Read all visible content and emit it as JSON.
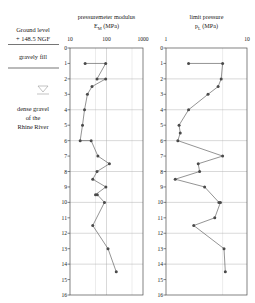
{
  "stratigraphy": {
    "ground_level_line1": "Ground level",
    "ground_level_line2": "+ 148.5 NGF",
    "layer1": "gravely fill",
    "water_table_icon": "water-table-icon",
    "layer2_line1": "dense gravel",
    "layer2_line2": "of the",
    "layer2_line3": "Rhine River"
  },
  "chart_data": [
    {
      "type": "line",
      "id": "pressuremeter-modulus",
      "title": "pressuremeter modulus",
      "subtitle": "E_M (MPa)",
      "title_line1": "pressuremeter modulus",
      "title_line2": "E",
      "title_sub": "M",
      "title_unit": " (MPa)",
      "xlabel": "E_M (MPa)",
      "ylabel": "depth (m)",
      "xscale": "log",
      "xlim": [
        10,
        1000
      ],
      "xticks": [
        10,
        100,
        1000
      ],
      "xticklabels": [
        "10",
        "100",
        "1000"
      ],
      "ylim": [
        0,
        16
      ],
      "yticks": [
        0,
        1,
        2,
        3,
        4,
        5,
        6,
        7,
        8,
        9,
        10,
        11,
        12,
        13,
        14,
        15,
        16
      ],
      "yticklabels": [
        "0",
        "1",
        "2",
        "3",
        "4",
        "5",
        "6",
        "7",
        "8",
        "9",
        "10",
        "11",
        "12",
        "13",
        "14",
        "15",
        "16"
      ],
      "ygrid_major": [
        0,
        2,
        4,
        6,
        8,
        10,
        12,
        14,
        16
      ],
      "grid": true,
      "legend": "none",
      "series": [
        {
          "name": "E_M profile",
          "marker": "filled-circle",
          "x": [
            26,
            95,
            55,
            95,
            40,
            30,
            25,
            22,
            19,
            38,
            58,
            120,
            55,
            42,
            96,
            50,
            56,
            88,
            42,
            110,
            185
          ],
          "depth": [
            1.0,
            1.0,
            2.0,
            2.0,
            2.5,
            3.0,
            4.0,
            5.0,
            6.0,
            6.0,
            7.0,
            7.5,
            8.0,
            8.5,
            9.0,
            9.5,
            9.5,
            10.0,
            11.5,
            13.0,
            14.5
          ]
        }
      ]
    },
    {
      "type": "line",
      "id": "limit-pressure",
      "title": "limit pressure",
      "subtitle": "p_L (MPa)",
      "title_line1": "limit pressure",
      "title_line2": "p",
      "title_sub": "L",
      "title_unit": " (MPa)",
      "xlabel": "p_L (MPa)",
      "ylabel": "depth (m)",
      "xscale": "log",
      "xlim": [
        1,
        10
      ],
      "xticks": [
        1,
        10
      ],
      "xticklabels": [
        "1",
        "10"
      ],
      "ylim": [
        0,
        16
      ],
      "yticks": [
        0,
        1,
        2,
        3,
        4,
        5,
        6,
        7,
        8,
        9,
        10,
        11,
        12,
        13,
        14,
        15,
        16
      ],
      "yticklabels": [
        "0",
        "1",
        "2",
        "3",
        "4",
        "5",
        "6",
        "7",
        "8",
        "9",
        "10",
        "11",
        "12",
        "13",
        "14",
        "15",
        "16"
      ],
      "ygrid_major": [
        0,
        2,
        4,
        6,
        8,
        10,
        12,
        14,
        16
      ],
      "grid": true,
      "legend": "none",
      "series": [
        {
          "name": "p_L profile",
          "marker": "filled-circle",
          "x": [
            1.9,
            5.0,
            4.8,
            4.4,
            3.3,
            1.9,
            1.45,
            1.5,
            1.4,
            5.0,
            2.5,
            2.6,
            1.3,
            3.0,
            4.5,
            4.7,
            4.0,
            2.2,
            5.2,
            5.4
          ],
          "depth": [
            1.0,
            1.0,
            2.0,
            2.5,
            3.0,
            4.0,
            5.0,
            5.5,
            6.0,
            7.0,
            7.5,
            8.0,
            8.5,
            9.0,
            10.0,
            10.0,
            11.0,
            11.5,
            13.0,
            14.5
          ]
        }
      ]
    }
  ]
}
